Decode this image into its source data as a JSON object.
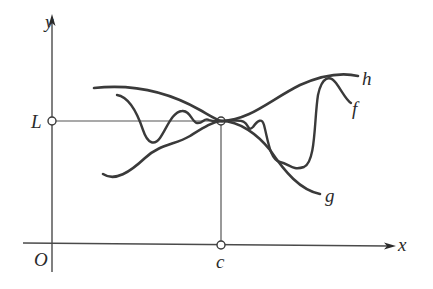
{
  "diagram": {
    "axes": {
      "x_label": "x",
      "y_label": "y",
      "origin_label": "O"
    },
    "points": {
      "limit_label": "L",
      "point_label": "c"
    },
    "curves": [
      {
        "name": "h",
        "label": "h",
        "role": "upper bound"
      },
      {
        "name": "f",
        "label": "f",
        "role": "squeezed function"
      },
      {
        "name": "g",
        "label": "g",
        "role": "lower bound"
      }
    ],
    "colors": {
      "curve": "#3a3a3a",
      "axis": "#4a4a4a",
      "background": "#ffffff"
    }
  }
}
